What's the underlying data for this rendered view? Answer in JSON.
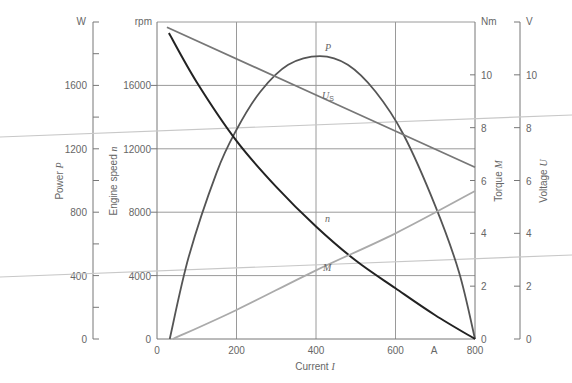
{
  "chart_data": {
    "type": "line",
    "title": "",
    "xlabel": "Current I",
    "x_unit": "A",
    "xlim": [
      0,
      800
    ],
    "x_ticks": [
      0,
      200,
      400,
      600,
      800
    ],
    "grid": true,
    "axes": {
      "power": {
        "label": "Power P",
        "unit": "W",
        "range": [
          0,
          2000
        ],
        "ticks": [
          0,
          400,
          800,
          1200,
          1600
        ]
      },
      "speed": {
        "label": "Engine speed n",
        "unit": "rpm",
        "range": [
          0,
          20000
        ],
        "ticks": [
          0,
          4000,
          8000,
          12000,
          16000
        ]
      },
      "torque": {
        "label": "Torque M",
        "unit": "Nm",
        "range": [
          0,
          12
        ],
        "ticks": [
          0,
          2,
          4,
          6,
          8,
          10
        ]
      },
      "voltage": {
        "label": "Voltage U",
        "unit": "V",
        "range": [
          0,
          12
        ],
        "ticks": [
          0,
          2,
          4,
          6,
          8,
          10
        ]
      }
    },
    "series": [
      {
        "name": "P",
        "axis": "power",
        "color": "#555555",
        "x": [
          32,
          80,
          150,
          200,
          260,
          330,
          410,
          480,
          550,
          620,
          700,
          760,
          800
        ],
        "values": [
          0,
          520,
          1050,
          1320,
          1560,
          1730,
          1785,
          1730,
          1560,
          1290,
          840,
          420,
          0
        ]
      },
      {
        "name": "n",
        "axis": "speed",
        "color": "#222222",
        "x": [
          30,
          100,
          200,
          300,
          400,
          500,
          600,
          700,
          800
        ],
        "values": [
          19300,
          16200,
          12500,
          9600,
          7100,
          4950,
          3200,
          1500,
          0
        ]
      },
      {
        "name": "U_S",
        "axis": "voltage",
        "color": "#777777",
        "x": [
          25,
          800
        ],
        "values": [
          11.8,
          6.5
        ]
      },
      {
        "name": "M",
        "axis": "torque",
        "color": "#aaaaaa",
        "x": [
          40,
          200,
          400,
          600,
          800
        ],
        "values": [
          0,
          1.1,
          2.6,
          4.0,
          5.6
        ]
      }
    ],
    "curve_labels": [
      {
        "text": "P",
        "x": 418,
        "y_px": 50
      },
      {
        "text": "U",
        "sub": "S",
        "x": 420,
        "y_px": 97
      },
      {
        "text": "n",
        "x": 420,
        "y_px": 222
      },
      {
        "text": "M",
        "x": 420,
        "y_px": 271
      }
    ]
  },
  "labels": {
    "unit_w": "W",
    "unit_rpm": "rpm",
    "unit_nm": "Nm",
    "unit_v": "V",
    "unit_a": "A",
    "power_axis": "Power ",
    "power_sym": "P",
    "speed_axis": "Engine speed ",
    "speed_sym": "n",
    "torque_axis": "Torque ",
    "torque_sym": "M",
    "voltage_axis": "Voltage ",
    "voltage_sym": "U",
    "x_axis": "Current ",
    "x_sym": "I",
    "curve_p": "P",
    "curve_us": "U",
    "curve_us_sub": "S",
    "curve_n": "n",
    "curve_m": "M"
  }
}
